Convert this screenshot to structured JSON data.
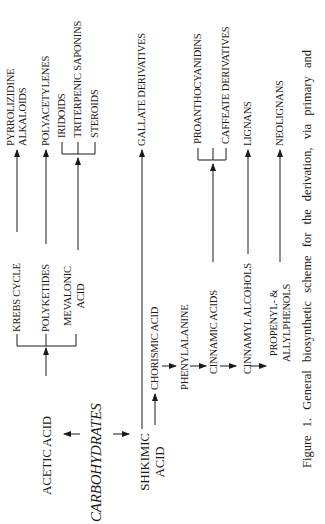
{
  "figure": {
    "caption": "Figure 1. General biosynthetic scheme for the derivation, via primary and",
    "orientation": "rotated-90-ccw"
  },
  "nodes": {
    "carbohydrates": "CARBOHYDRATES",
    "acetic_acid": "ACETIC ACID",
    "shikimic_acid_1": "SHIKIMIC",
    "shikimic_acid_2": "ACID",
    "krebs_cycle": "KREBS CYCLE",
    "polyketides": "POLYKETIDES",
    "mevalonic_acid_1": "MEVALONIC",
    "mevalonic_acid_2": "ACID",
    "pyrrolizidine_1": "PYRROLIZIDINE",
    "pyrrolizidine_2": "ALKALOIDS",
    "polyacetylenes": "POLYACETYLENES",
    "iridoids": "IRIDOIDS",
    "triterpenic_saponins": "TRITERPENIC SAPONINS",
    "steroids": "STEROIDS",
    "gallate_derivatives": "GALLATE DERIVATIVES",
    "chorismic_acid": "CHORISMIC ACID",
    "phenylalanine": "PHENYLALANINE",
    "cinnamic_acids": "CINNAMIC ACIDS",
    "cinnamyl_alcohols": "CINNAMYL ALCOHOLS",
    "propenyl_1": "PROPENYL- &",
    "propenyl_2": "ALLYLPHENOLS",
    "proanthocyanidins": "PROANTHOCYANIDINS",
    "caffeate_derivatives": "CAFFEATE DERIVATIVES",
    "lignans": "LIGNANS",
    "neolignans": "NEOLIGNANS"
  },
  "edges": [
    [
      "CARBOHYDRATES",
      "ACETIC ACID"
    ],
    [
      "CARBOHYDRATES",
      "SHIKIMIC ACID"
    ],
    [
      "ACETIC ACID",
      "KREBS CYCLE"
    ],
    [
      "ACETIC ACID",
      "POLYKETIDES"
    ],
    [
      "ACETIC ACID",
      "MEVALONIC ACID"
    ],
    [
      "KREBS CYCLE",
      "PYRROLIZIDINE ALKALOIDS"
    ],
    [
      "POLYKETIDES",
      "POLYACETYLENES"
    ],
    [
      "MEVALONIC ACID",
      "IRIDOIDS"
    ],
    [
      "MEVALONIC ACID",
      "TRITERPENIC SAPONINS"
    ],
    [
      "MEVALONIC ACID",
      "STEROIDS"
    ],
    [
      "SHIKIMIC ACID",
      "GALLATE DERIVATIVES"
    ],
    [
      "SHIKIMIC ACID",
      "CHORISMIC ACID"
    ],
    [
      "CHORISMIC ACID",
      "PHENYLALANINE"
    ],
    [
      "PHENYLALANINE",
      "CINNAMIC ACIDS"
    ],
    [
      "CINNAMIC ACIDS",
      "CINNAMYL ALCOHOLS"
    ],
    [
      "CINNAMYL ALCOHOLS",
      "PROPENYL- & ALLYLPHENOLS"
    ],
    [
      "CINNAMIC ACIDS",
      "PROANTHOCYANIDINS"
    ],
    [
      "CINNAMIC ACIDS",
      "CAFFEATE DERIVATIVES"
    ],
    [
      "CINNAMYL ALCOHOLS",
      "LIGNANS"
    ],
    [
      "PROPENYL- & ALLYLPHENOLS",
      "NEOLIGNANS"
    ]
  ]
}
